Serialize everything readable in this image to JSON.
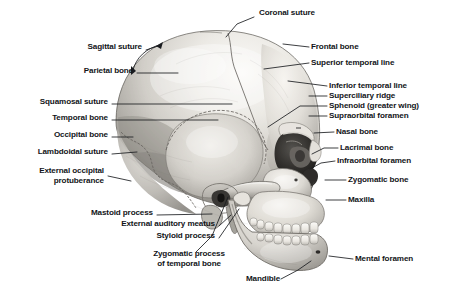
{
  "figure": {
    "view": "left lateral, facing right",
    "background_color": "#ffffff",
    "label_color": "#121418",
    "leader_color": "#1a1c20",
    "art_tones": {
      "bone_light": "#f2f0ec",
      "bone_mid": "#c9c6c0",
      "bone_shadow": "#8e8b85",
      "deep_shadow": "#4a4845",
      "cavity": "#2a2a28"
    }
  },
  "labels": [
    {
      "id": "coronal-suture",
      "text": "Coronal suture",
      "x": 259,
      "y": 11,
      "align": "left"
    },
    {
      "id": "sagittal-suture",
      "text": "Sagittal suture",
      "x": 56,
      "y": 46,
      "align": "right",
      "right": 142
    },
    {
      "id": "frontal-bone",
      "text": "Frontal bone",
      "x": 311,
      "y": 43,
      "align": "left"
    },
    {
      "id": "parietal-bone",
      "text": "Parietal bone",
      "x": 49,
      "y": 70,
      "align": "right",
      "right": 133
    },
    {
      "id": "superior-temporal-line",
      "text": "Superior temporal line",
      "x": 311,
      "y": 59,
      "align": "left"
    },
    {
      "id": "inferior-temporal-line",
      "text": "Inferior temporal line",
      "x": 329,
      "y": 82,
      "align": "left"
    },
    {
      "id": "squamosal-suture",
      "text": "Squamosal suture",
      "x": 24,
      "y": 101,
      "align": "right",
      "right": 108
    },
    {
      "id": "superciliary-ridge",
      "text": "Superciliary ridge",
      "x": 329,
      "y": 92,
      "align": "left"
    },
    {
      "id": "sphenoid-greater-wing",
      "text": "Sphenoid (greater wing)",
      "x": 329,
      "y": 102,
      "align": "left"
    },
    {
      "id": "temporal-bone",
      "text": "Temporal bone",
      "x": 39,
      "y": 117,
      "align": "right",
      "right": 108
    },
    {
      "id": "supraorbital-foramen",
      "text": "Supraorbital foramen",
      "x": 329,
      "y": 112,
      "align": "left"
    },
    {
      "id": "occipital-bone",
      "text": "Occipital bone",
      "x": 37,
      "y": 134,
      "align": "right",
      "right": 108
    },
    {
      "id": "nasal-bone",
      "text": "Nasal bone",
      "x": 336,
      "y": 128,
      "align": "left"
    },
    {
      "id": "lambdoidal-suture",
      "text": "Lambdoidal suture",
      "x": 22,
      "y": 151,
      "align": "right",
      "right": 108
    },
    {
      "id": "lacrimal-bone",
      "text": "Lacrimal bone",
      "x": 340,
      "y": 144,
      "align": "left"
    },
    {
      "id": "infraorbital-foramen",
      "text": "Infraorbital foramen",
      "x": 337,
      "y": 157,
      "align": "left"
    },
    {
      "id": "external-occipital-protuberance",
      "text": "External occipital\nprotuberance",
      "x": 20,
      "y": 170,
      "align": "right",
      "right": 104
    },
    {
      "id": "zygomatic-bone",
      "text": "Zygomatic bone",
      "x": 348,
      "y": 176,
      "align": "left"
    },
    {
      "id": "maxilla",
      "text": "Maxilla",
      "x": 348,
      "y": 196,
      "align": "left"
    },
    {
      "id": "mastoid-process",
      "text": "Mastoid process",
      "x": 69,
      "y": 212,
      "align": "right",
      "right": 153
    },
    {
      "id": "external-auditory-meatus",
      "text": "External auditory meatus",
      "x": 60,
      "y": 223,
      "align": "right",
      "right": 215
    },
    {
      "id": "styloid-process",
      "text": "Styloid process",
      "x": 129,
      "y": 235,
      "align": "right",
      "right": 215
    },
    {
      "id": "zygomatic-process-of-temporal-bone",
      "text": "Zygomatic process\nof temporal bone",
      "x": 137,
      "y": 253,
      "align": "center"
    },
    {
      "id": "mental-foramen",
      "text": "Mental foramen",
      "x": 355,
      "y": 255,
      "align": "left"
    },
    {
      "id": "mandible",
      "text": "Mandible",
      "x": 246,
      "y": 276,
      "align": "left"
    }
  ],
  "leaders": [
    {
      "id": "leader-coronal-suture",
      "points": "254,17 237,24 225,38"
    },
    {
      "id": "leader-sagittal-suture",
      "points": "146,50 158,45",
      "arrows": "double",
      "arc": "128,28 138,68"
    },
    {
      "id": "leader-frontal-bone",
      "points": "309,47 283,44"
    },
    {
      "id": "leader-parietal-bone",
      "points": "137,73 178,73"
    },
    {
      "id": "leader-superior-temporal-line",
      "points": "309,63 265,68"
    },
    {
      "id": "leader-inferior-temporal-line",
      "points": "327,86 288,80"
    },
    {
      "id": "leader-squamosal-suture",
      "points": "112,104 232,104"
    },
    {
      "id": "leader-superciliary-ridge",
      "points": "327,96 308,96"
    },
    {
      "id": "leader-sphenoid",
      "points": "327,106 300,106 268,126"
    },
    {
      "id": "leader-temporal-bone",
      "points": "112,120 218,120"
    },
    {
      "id": "leader-supraorbital-foramen",
      "points": "327,116 308,116"
    },
    {
      "id": "leader-occipital-bone",
      "points": "112,137 133,137"
    },
    {
      "id": "leader-nasal-bone",
      "points": "334,132 314,132"
    },
    {
      "id": "leader-lambdoidal-suture",
      "points": "112,154 136,152"
    },
    {
      "id": "leader-lacrimal-bone",
      "points": "338,148 325,148 313,153"
    },
    {
      "id": "leader-infraorbital-foramen",
      "points": "335,161 322,163 312,168"
    },
    {
      "id": "leader-external-occipital-protuberance",
      "points": "108,176 130,180"
    },
    {
      "id": "leader-zygomatic-bone",
      "points": "346,180 326,180"
    },
    {
      "id": "leader-maxilla",
      "points": "346,200 327,200"
    },
    {
      "id": "leader-mastoid-process",
      "points": "157,215 213,215"
    },
    {
      "id": "leader-external-auditory-meatus",
      "points": "219,226 232,216"
    },
    {
      "id": "leader-styloid-process",
      "points": "219,238 240,208"
    },
    {
      "id": "leader-zygomatic-process",
      "points": "196,252 212,236 228,196"
    },
    {
      "id": "leader-mental-foramen",
      "points": "353,259 330,259"
    },
    {
      "id": "leader-mandible",
      "points": "281,279 300,270 312,262"
    }
  ]
}
